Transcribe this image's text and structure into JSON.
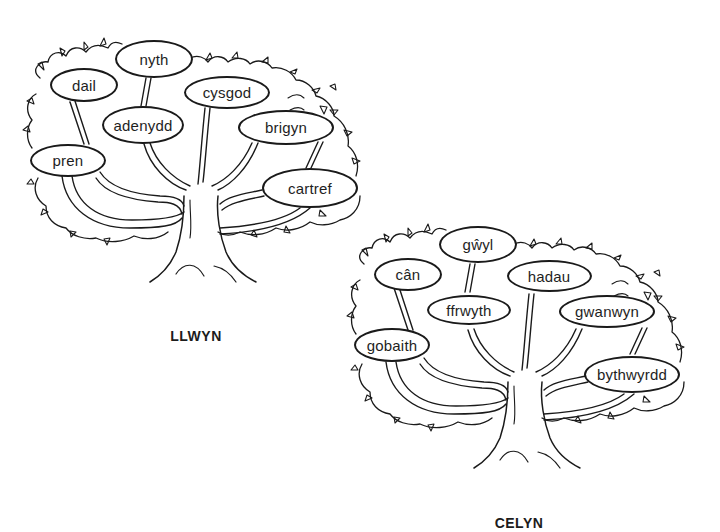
{
  "trees": [
    {
      "id": "llwyn",
      "label": "LLWYN",
      "words": [
        {
          "text": "nyth",
          "x": 154,
          "y": 59,
          "w": 78,
          "h": 38
        },
        {
          "text": "dail",
          "x": 84,
          "y": 85,
          "w": 68,
          "h": 34
        },
        {
          "text": "cysgod",
          "x": 227,
          "y": 92,
          "w": 86,
          "h": 33
        },
        {
          "text": "adenydd",
          "x": 143,
          "y": 125,
          "w": 82,
          "h": 38
        },
        {
          "text": "brigyn",
          "x": 286,
          "y": 127,
          "w": 96,
          "h": 35
        },
        {
          "text": "pren",
          "x": 68,
          "y": 160,
          "w": 76,
          "h": 33
        },
        {
          "text": "cartref",
          "x": 310,
          "y": 188,
          "w": 96,
          "h": 40
        }
      ]
    },
    {
      "id": "celyn",
      "label": "CELYN",
      "words": [
        {
          "text": "gŵyl",
          "x": 478,
          "y": 244,
          "w": 78,
          "h": 37
        },
        {
          "text": "cân",
          "x": 408,
          "y": 274,
          "w": 68,
          "h": 33
        },
        {
          "text": "hadau",
          "x": 549,
          "y": 276,
          "w": 85,
          "h": 32
        },
        {
          "text": "ffrwyth",
          "x": 469,
          "y": 310,
          "w": 84,
          "h": 30
        },
        {
          "text": "gwanwyn",
          "x": 607,
          "y": 311,
          "w": 96,
          "h": 33
        },
        {
          "text": "gobaith",
          "x": 392,
          "y": 345,
          "w": 76,
          "h": 34
        },
        {
          "text": "bythwyrdd",
          "x": 632,
          "y": 374,
          "w": 96,
          "h": 37
        }
      ]
    }
  ]
}
